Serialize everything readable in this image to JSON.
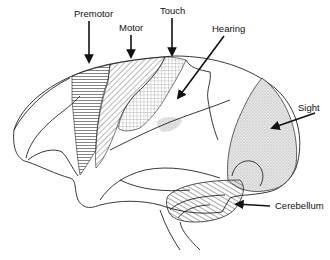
{
  "diagram": {
    "labels": {
      "premotor": "Premotor",
      "motor": "Motor",
      "touch": "Touch",
      "hearing": "Hearing",
      "sight": "Sight",
      "cerebellum": "Cerebellum"
    },
    "colors": {
      "ink": "#222222",
      "background": "#ffffff",
      "stipple": "#bdbdbd"
    }
  }
}
